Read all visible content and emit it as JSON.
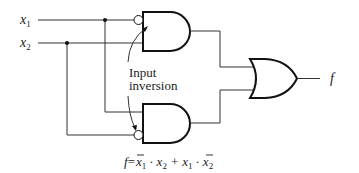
{
  "inputs": [
    {
      "name": "x",
      "sub": "1"
    },
    {
      "name": "x",
      "sub": "2"
    }
  ],
  "output": {
    "name": "f"
  },
  "annotation": {
    "line1": "Input",
    "line2": "inversion"
  },
  "gates": [
    "AND",
    "AND",
    "OR"
  ],
  "equation": {
    "lhs": "f",
    "eq": "=",
    "terms": [
      {
        "a": "x",
        "a_sub": "1",
        "a_bar": true,
        "b": "x",
        "b_sub": "2",
        "b_bar": false
      },
      {
        "a": "x",
        "a_sub": "1",
        "a_bar": false,
        "b": "x",
        "b_sub": "2",
        "b_bar": true
      }
    ],
    "dot": "·",
    "plus": "+"
  }
}
